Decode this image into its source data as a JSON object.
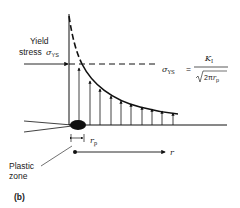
{
  "figure": {
    "caption": "(b)",
    "yield_label_line1": "Yield",
    "yield_label_line2": "stress",
    "yield_symbol": "σ",
    "yield_symbol_sub": "YS",
    "formula": {
      "lhs": "σ",
      "lhs_sub": "YS",
      "equals": "=",
      "numerator": "K",
      "numerator_sub": "I",
      "denominator_prefix": "2π",
      "denominator_var": "r",
      "denominator_sub": "p"
    },
    "rp_label": "r",
    "rp_sub": "p",
    "plastic_zone_line1": "Plastic",
    "plastic_zone_line2": "zone",
    "r_axis_label": "r",
    "colors": {
      "ink": "#111111",
      "background": "#ffffff"
    }
  }
}
